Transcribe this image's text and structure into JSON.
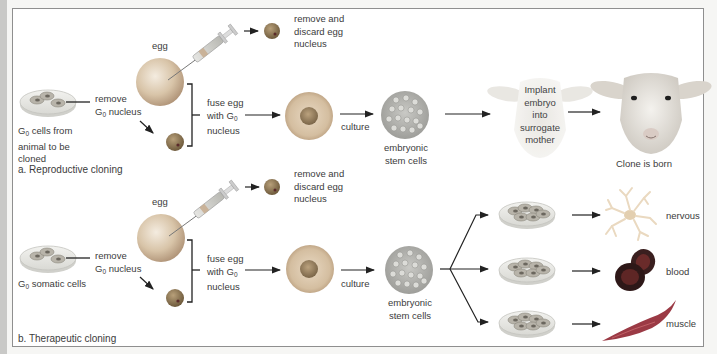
{
  "figure": {
    "panels": [
      {
        "id": "a",
        "title": "a. Reproductive cloning",
        "source_cells_label": [
          "G",
          "0",
          " cells from",
          "animal to be",
          "cloned"
        ],
        "remove_label": [
          "remove",
          "G",
          "0",
          " nucleus"
        ],
        "egg_label": "egg",
        "discard_label": [
          "remove and",
          "discard egg",
          "nucleus"
        ],
        "fuse_label": [
          "fuse egg",
          "with G",
          "0",
          "nucleus"
        ],
        "culture_label": "culture",
        "stem_label": [
          "embryonic",
          "stem cells"
        ],
        "implant_label": [
          "Implant",
          "embryo",
          "into",
          "surrogate",
          "mother"
        ],
        "result_label": "Clone is born"
      },
      {
        "id": "b",
        "title": "b. Therapeutic cloning",
        "source_cells_label": [
          "G",
          "0",
          " somatic cells"
        ],
        "remove_label": [
          "remove",
          "G",
          "0",
          " nucleus"
        ],
        "egg_label": "egg",
        "discard_label": [
          "remove and",
          "discard egg",
          "nucleus"
        ],
        "fuse_label": [
          "fuse egg",
          "with G",
          "0",
          "nucleus"
        ],
        "culture_label": "culture",
        "stem_label": [
          "embryonic",
          "stem cells"
        ],
        "outcomes": [
          {
            "label": "nervous",
            "icon": "nerve-cell"
          },
          {
            "label": "blood",
            "icon": "blood-cells"
          },
          {
            "label": "muscle",
            "icon": "muscle-cell"
          }
        ]
      }
    ],
    "colors": {
      "frame_border": "#8f8f8f",
      "arrow": "#222222",
      "egg": "#d2b99a",
      "nucleus": "#7a6a4e",
      "blood": "#3b1e1e",
      "muscle": "#9b3a45",
      "nerve": "#efe6d6"
    }
  }
}
